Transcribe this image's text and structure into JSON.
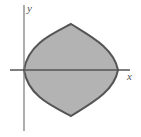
{
  "diagram": {
    "type": "shaded-region-plot",
    "axes": {
      "x_label": "x",
      "y_label": "y"
    },
    "region": {
      "description": "Shaded lens-shaped region bounded by curves, symmetric about the x-axis, touching the y-axis at the origin",
      "fill_color": "#b3b3b3",
      "stroke_color": "#555555"
    },
    "colors": {
      "axis": "#777777",
      "background": "#ffffff"
    }
  }
}
